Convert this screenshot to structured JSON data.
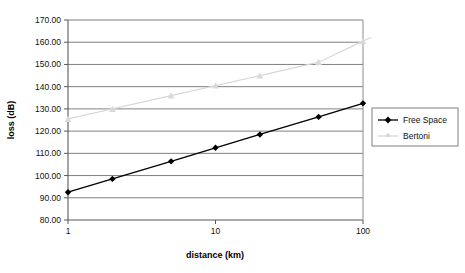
{
  "chart_data": {
    "type": "line",
    "title": "",
    "xlabel": "distance (km)",
    "ylabel": "loss (dB)",
    "xscale": "log",
    "xlim": [
      1,
      100
    ],
    "ylim": [
      80.0,
      170.0
    ],
    "ytick_step": 10.0,
    "grid": "horizontal",
    "legend_position": "right",
    "x": [
      1,
      2,
      5,
      10,
      20,
      50,
      100
    ],
    "xtick_labels": [
      "1",
      "10",
      "100"
    ],
    "ytick_labels": [
      "80.00",
      "90.00",
      "100.00",
      "110.00",
      "120.00",
      "130.00",
      "140.00",
      "150.00",
      "160.00",
      "170.00"
    ],
    "series": [
      {
        "name": "Free Space",
        "color": "#000000",
        "marker": "diamond",
        "values": [
          92.5,
          98.5,
          106.4,
          112.5,
          118.5,
          126.4,
          132.5
        ]
      },
      {
        "name": "Bertoni",
        "color": "#d9d9d9",
        "marker": "triangle",
        "values": [
          125.5,
          130.0,
          136.0,
          140.5,
          145.0,
          151.0,
          160.5
        ]
      }
    ]
  },
  "legend": {
    "entries": [
      {
        "label": "Free Space"
      },
      {
        "label": "Bertoni"
      }
    ]
  },
  "axes": {
    "x_title": "distance (km)",
    "y_title": "loss (dB)"
  },
  "colors": {
    "free_space": "#000000",
    "bertoni": "#d9d9d9",
    "gridline": "#808080",
    "axis": "#595959",
    "plot_background": "#ffffff"
  }
}
